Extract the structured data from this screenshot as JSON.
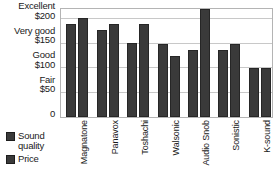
{
  "chart_data": {
    "type": "bar",
    "title": "",
    "xlabel": "",
    "ylabel": "",
    "grid": true,
    "legend_position": "bottom-left",
    "ylim": [
      0,
      225
    ],
    "categories": [
      "Magnatone",
      "Panavox",
      "Toshachi",
      "Walsonic",
      "Audio Snob",
      "Sonistic",
      "K-sound"
    ],
    "series": [
      {
        "name": "Sound quality",
        "values": [
          190,
          178,
          152,
          150,
          138,
          138,
          100
        ]
      },
      {
        "name": "Price",
        "values": [
          202,
          190,
          190,
          124,
          220,
          150,
          100
        ]
      }
    ],
    "y_ticks": [
      {
        "value": 200,
        "rating": "Excellent",
        "price": "$200"
      },
      {
        "value": 150,
        "rating": "Very good",
        "price": "$150"
      },
      {
        "value": 100,
        "rating": "Good",
        "price": "$100"
      },
      {
        "value": 50,
        "rating": "Fair",
        "price": "$50"
      },
      {
        "value": 0,
        "rating": "",
        "price": "0"
      }
    ]
  },
  "legend": {
    "items": [
      {
        "label": "Sound quality",
        "color": "#3a3a3a"
      },
      {
        "label": "Price",
        "color": "#3a3a3a"
      }
    ]
  },
  "colors": {
    "bar": "#3a3a3a",
    "bar_border": "#262626",
    "gridline": "#c8c8c8",
    "plot_border": "#b4b4b4",
    "text": "#1a1a1a"
  }
}
